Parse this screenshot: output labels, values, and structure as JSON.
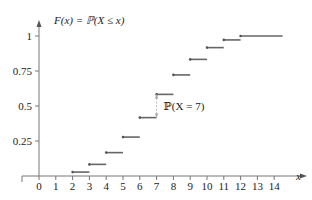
{
  "chart_data": {
    "type": "line",
    "subtype": "step-cdf",
    "title": "F(x) = ℙ(X ≤ x)",
    "xlabel": "x",
    "ylabel": "",
    "x_ticks": [
      "0",
      "1",
      "2",
      "3",
      "4",
      "5",
      "6",
      "7",
      "8",
      "9",
      "10",
      "11",
      "12",
      "13",
      "14"
    ],
    "y_ticks": [
      "0.25",
      "0.5",
      "0.75",
      "1"
    ],
    "xlim": [
      0,
      14.5
    ],
    "ylim": [
      0,
      1
    ],
    "grid": false,
    "legend": null,
    "steps": [
      {
        "x_start": 2,
        "x_end": 3,
        "value": 0.028
      },
      {
        "x_start": 3,
        "x_end": 4,
        "value": 0.083
      },
      {
        "x_start": 4,
        "x_end": 5,
        "value": 0.167
      },
      {
        "x_start": 5,
        "x_end": 6,
        "value": 0.278
      },
      {
        "x_start": 6,
        "x_end": 7,
        "value": 0.417
      },
      {
        "x_start": 7,
        "x_end": 8,
        "value": 0.583
      },
      {
        "x_start": 8,
        "x_end": 9,
        "value": 0.722
      },
      {
        "x_start": 9,
        "x_end": 10,
        "value": 0.833
      },
      {
        "x_start": 10,
        "x_end": 11,
        "value": 0.917
      },
      {
        "x_start": 11,
        "x_end": 12,
        "value": 0.972
      },
      {
        "x_start": 12,
        "x_end": 14.5,
        "value": 1.0
      }
    ],
    "annotations": [
      {
        "text": "ℙ(X = 7)",
        "x": 7,
        "y_from": 0.417,
        "y_to": 0.583
      }
    ]
  },
  "labels": {
    "title": "F(x) = ℙ(X ≤ x)",
    "x_axis": "x",
    "annotation": "ℙ(X = 7)"
  }
}
